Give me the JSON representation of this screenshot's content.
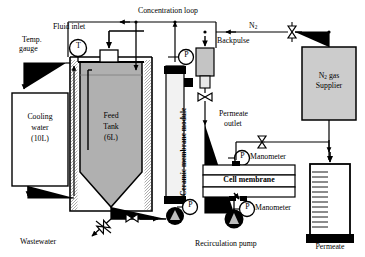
{
  "diagram": {
    "type": "process-flow-diagram"
  },
  "labels": {
    "fluid_inlet": "Fluid inlet",
    "temp_gauge_line1": "Temp.",
    "temp_gauge_line2": "gauge",
    "concentration_loop": "Concentration loop",
    "backpulse": "Backpulse",
    "nitrogen": "N",
    "nitrogen_sub": "2",
    "n2_supplier_line1": "N",
    "n2_supplier_line1_sub": "2",
    "n2_supplier_line1_tail": " gas",
    "n2_supplier_line2": "Supplier",
    "cooling_water_line1": "Cooling",
    "cooling_water_line2": "water",
    "cooling_water_line3": "(10L)",
    "feed_tank_line1": "Feed",
    "feed_tank_line2": "Tank",
    "feed_tank_line3": "(6L)",
    "ceramic_membrane_module": "Ceramic membrane module",
    "permeate_outlet_line1": "Permeate",
    "permeate_outlet_line2": "outlet",
    "manometer_upper": "Manometer",
    "manometer_lower": "Manometer",
    "cell_membrane": "Cell membrane",
    "recirculation_pump": "Recirculation pump",
    "permeate": "Permeate",
    "wastewater": "Wastewater"
  },
  "instruments": {
    "temperature_gauge_glyph": "T",
    "pressure_gauge_glyph": "P",
    "pressure_gauges_count": 4
  },
  "vessels": {
    "cooling_water": {
      "name": "Cooling water",
      "capacity": "10L",
      "fill": "#ffffff"
    },
    "feed_tank": {
      "name": "Feed Tank",
      "capacity": "6L",
      "fill": "#b0b0b0"
    },
    "n2_supplier": {
      "name": "N2 gas Supplier",
      "fill": "#cccccc"
    },
    "permeate_cylinder": {
      "name": "Permeate",
      "graduations": 12
    }
  },
  "colors": {
    "line": "#000000",
    "feed_fill": "#b0b0b0",
    "gas_fill": "#cccccc",
    "backpulse_fill": "#c4c4c4",
    "module_fill": "#f2f2f2",
    "background": "#ffffff"
  },
  "components": {
    "valves": 4,
    "pumps": 2,
    "membrane_module": "Ceramic membrane module",
    "cell": "Cell membrane"
  }
}
